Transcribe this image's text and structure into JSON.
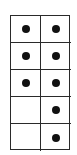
{
  "frame": {
    "rows": 5,
    "cols": 2,
    "line_color": "#2a2a2a",
    "dot_color": "#111111",
    "cells": [
      [
        true,
        true
      ],
      [
        true,
        true
      ],
      [
        true,
        true
      ],
      [
        false,
        true
      ],
      [
        false,
        true
      ]
    ],
    "dot_count": 8
  }
}
